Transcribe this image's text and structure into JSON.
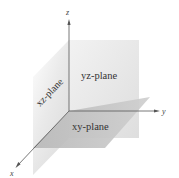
{
  "diagram": {
    "axes": [
      {
        "name": "x",
        "label": "x"
      },
      {
        "name": "y",
        "label": "y"
      },
      {
        "name": "z",
        "label": "z"
      }
    ],
    "planes": [
      {
        "name": "yz-plane",
        "label": "yz-plane"
      },
      {
        "name": "xz-plane",
        "label": "xz-plane"
      },
      {
        "name": "xy-plane",
        "label": "xy-plane"
      }
    ],
    "colors": {
      "yz_plane": "#e6e6e6",
      "xz_plane": "#ececec",
      "xy_plane": "#c4c4c4",
      "axis": "#555555",
      "background": "#ffffff"
    }
  }
}
